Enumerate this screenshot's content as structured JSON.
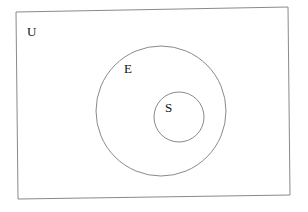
{
  "diagram": {
    "type": "venn",
    "universe": {
      "label": "U"
    },
    "sets": [
      {
        "label": "E"
      },
      {
        "label": "S"
      }
    ],
    "relation": "S is a subset of E, E is a subset of U",
    "colors": {
      "stroke": "#8a8a8a",
      "text": "#111111",
      "background": "#ffffff"
    }
  }
}
